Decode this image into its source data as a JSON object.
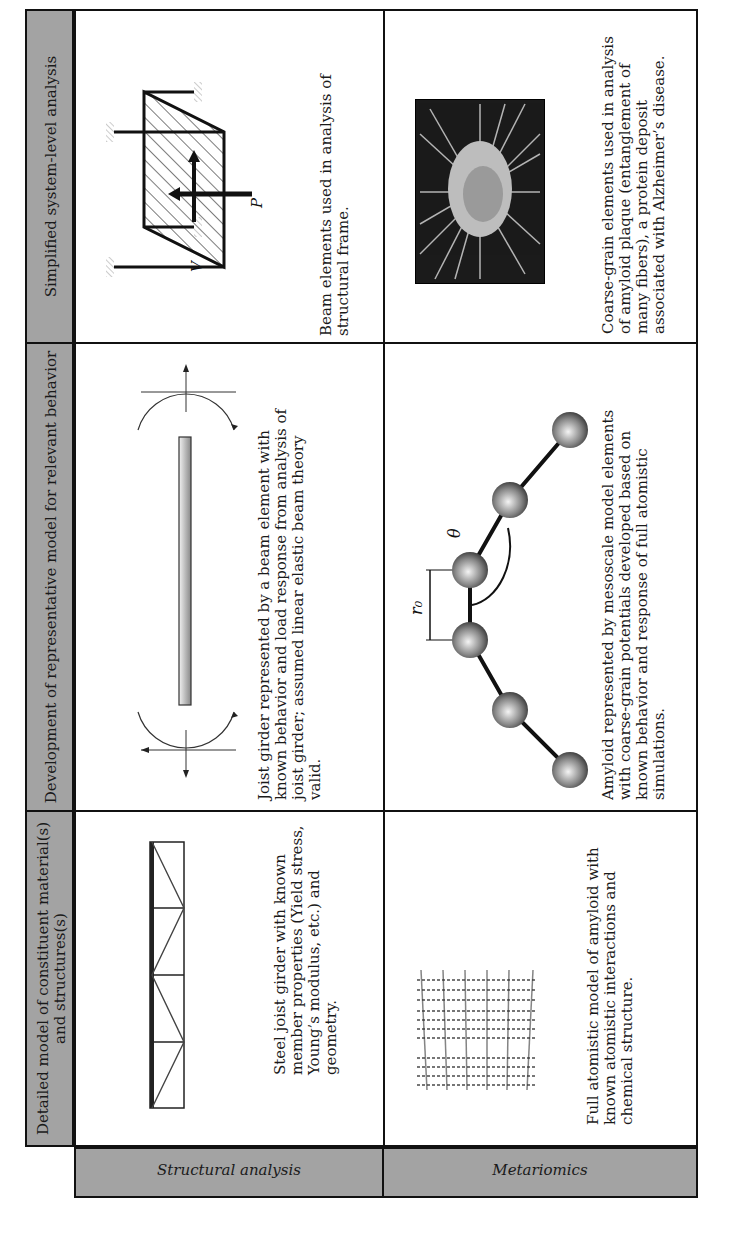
{
  "table": {
    "column_headers": [
      "Detailed model of constituent material(s) and structures(s)",
      "Development of representative model for relevant behavior",
      "Simplified system-level analysis"
    ],
    "rows": [
      {
        "label": "Structural analysis",
        "cells": [
          {
            "figure": "steel-joist-truss",
            "text": "Steel joist girder with known member properties (Yield stress, Young’s modulus, etc.) and geometry."
          },
          {
            "figure": "beam-element-with-moments",
            "text": "Joist girder represented by a beam element with known behavior and load response from analysis of joist girder; assumed linear elastic beam theory valid."
          },
          {
            "figure": "structural-frame",
            "figure_labels": [
              "P",
              "V"
            ],
            "text": "Beam elements used in analysis of structural frame."
          }
        ]
      },
      {
        "label": "Metariomics",
        "cells": [
          {
            "figure": "atomistic-amyloid-fibril",
            "text": "Full atomistic model of amyloid with known atomistic interactions and chemical structure."
          },
          {
            "figure": "coarse-grain-bead-chain",
            "figure_labels": [
              "r₀",
              "θ"
            ],
            "text": "Amyloid represented by mesoscale model elements with coarse-grain potentials developed based on known behavior and response of full atomistic simulations."
          },
          {
            "figure": "amyloid-plaque-micrograph",
            "text": "Coarse-grain elements used in analysis of amyloid plaque (entanglement of many fibers), a protein deposit associated with Alzheimer’s disease."
          }
        ]
      }
    ]
  },
  "colors": {
    "header_fill": "#a3a3a3",
    "border": "#111111"
  }
}
